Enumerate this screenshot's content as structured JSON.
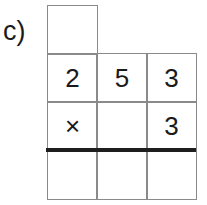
{
  "problem": {
    "label": "c)",
    "carry_row": [
      ""
    ],
    "multiplicand": [
      "2",
      "5",
      "3"
    ],
    "multiplier_row": [
      "×",
      "",
      "3"
    ],
    "result_row": [
      "",
      "",
      ""
    ]
  }
}
